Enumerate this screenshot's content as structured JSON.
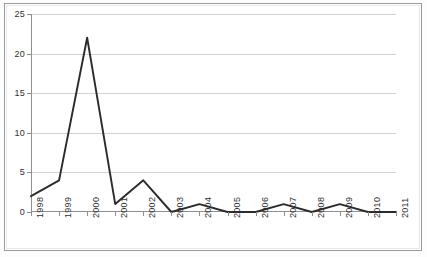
{
  "chart_data": {
    "type": "line",
    "title": "",
    "subtitle": "",
    "xlabel": "",
    "ylabel": "",
    "categories": [
      "1998",
      "1999",
      "2000",
      "2001",
      "2002",
      "2003",
      "2004",
      "2005",
      "2006",
      "2007",
      "2008",
      "2009",
      "2010",
      "2011"
    ],
    "values": [
      2,
      4,
      22,
      1,
      4,
      0,
      1,
      0,
      0,
      1,
      0,
      1,
      0,
      0
    ],
    "series": [
      {
        "name": "series-1",
        "values": [
          2,
          4,
          22,
          1,
          4,
          0,
          1,
          0,
          0,
          1,
          0,
          1,
          0,
          0
        ],
        "color": "#2b2b2b"
      }
    ],
    "ylim": [
      0,
      25
    ],
    "xlim": [
      0,
      13
    ],
    "ytick_labels": [
      "0",
      "5",
      "10",
      "15",
      "20",
      "25"
    ],
    "ytick_values": [
      0,
      5,
      10,
      15,
      20,
      25
    ],
    "xtick_labels": [
      "1998",
      "1999",
      "2000",
      "2001",
      "2002",
      "2003",
      "2004",
      "2005",
      "2006",
      "2007",
      "2008",
      "2009",
      "2010",
      "2011"
    ],
    "grid": true,
    "grid_axis": "y",
    "legend": false,
    "legend_position": "none",
    "markers": false,
    "annotations": [],
    "peak": {
      "category": "2000",
      "value": 22
    }
  },
  "style": {
    "line_color": "#2b2b2b",
    "grid_color": "#d2d2d2",
    "axis_color": "#8f8f8f",
    "frame_color": "#9a9a9a",
    "background": "#ffffff",
    "tick_text_color": "#2f2f2f"
  }
}
